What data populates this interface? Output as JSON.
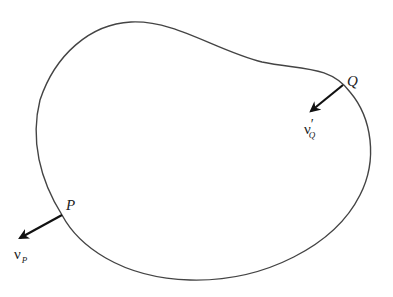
{
  "diagram": {
    "type": "closed region with outward normals",
    "points": [
      {
        "id": "P",
        "label": "P",
        "x": 62,
        "y": 215
      },
      {
        "id": "Q",
        "label": "Q",
        "x": 343,
        "y": 85
      }
    ],
    "vectors": [
      {
        "id": "nu_P",
        "symbol": "ν",
        "subscript": "P",
        "prime": "",
        "from": "P",
        "direction": "outward-lower-left"
      },
      {
        "id": "nu_Q_prime",
        "symbol": "ν",
        "subscript": "Q",
        "prime": "′",
        "from": "Q",
        "direction": "inward-lower-left"
      }
    ],
    "colors": {
      "curve": "#444444",
      "arrow": "#111111",
      "text": "#222222"
    }
  }
}
